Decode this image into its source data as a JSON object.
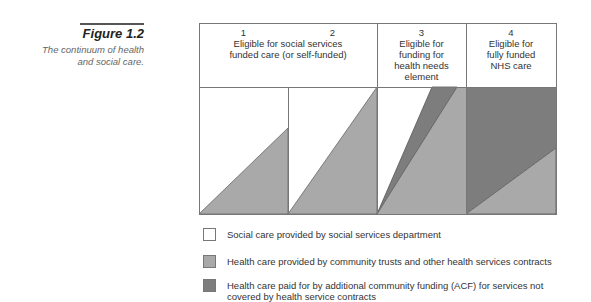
{
  "figure": {
    "label": "Figure 1.2",
    "caption": "The continuum of health and social care."
  },
  "colors": {
    "social_care": "#ffffff",
    "health_care_contracts": "#a9a9a9",
    "health_care_acf": "#7d7d7d",
    "border": "#777777"
  },
  "columns": [
    {
      "number": "1",
      "label": ""
    },
    {
      "number": "2",
      "label": ""
    },
    {
      "number": "3",
      "label": "Eligible for funding for health needs element"
    },
    {
      "number": "4",
      "label": "Eligible for fully funded NHS care"
    }
  ],
  "merged_header": "Eligible for social services funded care (or self-funded)",
  "legend": [
    {
      "key": "social_care",
      "label": "Social care provided by social services department"
    },
    {
      "key": "health_care_contracts",
      "label": "Health care provided by community trusts and other health services contracts"
    },
    {
      "key": "health_care_acf",
      "label": "Health care paid for by additional community funding (ACF) for services not covered by health service contracts"
    }
  ]
}
